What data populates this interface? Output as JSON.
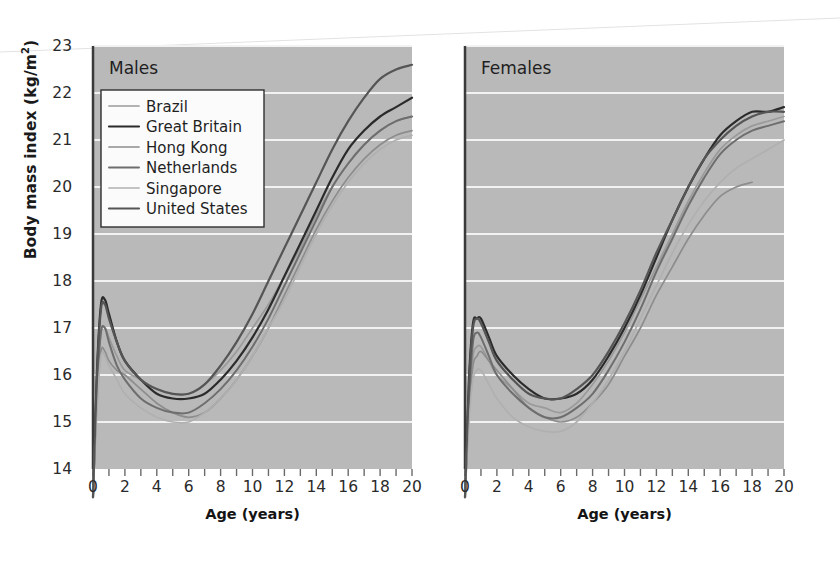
{
  "figure": {
    "background": "#ffffff",
    "plot_background": "#b9b9b9",
    "gridline_color": "#f2f2f2",
    "axis_color": "#3a3a3a"
  },
  "axes": {
    "ylabel_text": "Body mass index (kg/m",
    "ylabel_sup": "2",
    "ylabel_tail": ")",
    "ylabel_full": "Body mass index (kg/m2)",
    "yticks": [
      14,
      15,
      16,
      17,
      18,
      19,
      20,
      21,
      22,
      23
    ],
    "ylim": [
      14,
      23
    ],
    "xticks": [
      0,
      2,
      4,
      6,
      8,
      10,
      12,
      14,
      16,
      18,
      20
    ],
    "xlim": [
      0,
      20
    ],
    "xlabel": "Age (years)",
    "minor_xticks": [
      1,
      3,
      5,
      7,
      9,
      11,
      13,
      15,
      17,
      19
    ]
  },
  "panels": [
    {
      "id": "males",
      "title": "Males"
    },
    {
      "id": "females",
      "title": "Females"
    }
  ],
  "legend": {
    "position": "upper-left-of-males-panel",
    "entries": [
      {
        "label": "Brazil",
        "color": "#9a9a9a",
        "width": 1.7
      },
      {
        "label": "Great Britain",
        "color": "#2b2b2b",
        "width": 2.2
      },
      {
        "label": "Hong Kong",
        "color": "#8d8d8d",
        "width": 1.7
      },
      {
        "label": "Netherlands",
        "color": "#6e6e6e",
        "width": 2.0
      },
      {
        "label": "Singapore",
        "color": "#b0b0b0",
        "width": 1.7
      },
      {
        "label": "United States",
        "color": "#555555",
        "width": 2.2
      }
    ]
  },
  "chart_data": {
    "type": "line",
    "title": "",
    "xlabel": "Age (years)",
    "ylabel": "Body mass index (kg/m2)",
    "xlim": [
      0,
      20
    ],
    "ylim": [
      14,
      23
    ],
    "grid": "horizontal",
    "legend_position": "upper left (Males panel)",
    "x": [
      0,
      0.25,
      0.5,
      0.75,
      1,
      1.5,
      2,
      3,
      4,
      5,
      6,
      7,
      8,
      9,
      10,
      11,
      12,
      13,
      14,
      15,
      16,
      17,
      18,
      19,
      20
    ],
    "panels": [
      {
        "name": "Males",
        "series": [
          {
            "name": "Brazil",
            "color": "#9a9a9a",
            "values": [
              13.4,
              15.6,
              16.9,
              17.0,
              16.8,
              16.4,
              16.1,
              15.9,
              15.7,
              15.6,
              15.6,
              15.8,
              16.1,
              16.5,
              17.0,
              17.5,
              18.1,
              18.7,
              19.4,
              20.0,
              20.5,
              20.9,
              21.2,
              21.4,
              21.5
            ]
          },
          {
            "name": "Great Britain",
            "color": "#2b2b2b",
            "values": [
              13.4,
              16.1,
              17.5,
              17.6,
              17.3,
              16.7,
              16.3,
              15.9,
              15.6,
              15.5,
              15.5,
              15.6,
              15.9,
              16.3,
              16.8,
              17.4,
              18.1,
              18.8,
              19.5,
              20.2,
              20.8,
              21.2,
              21.5,
              21.7,
              21.9
            ]
          },
          {
            "name": "Hong Kong",
            "color": "#8d8d8d",
            "values": [
              13.4,
              15.4,
              16.5,
              16.5,
              16.3,
              16.1,
              16.0,
              15.7,
              15.4,
              15.2,
              15.1,
              15.2,
              15.5,
              15.9,
              16.4,
              17.0,
              17.7,
              18.4,
              19.1,
              19.7,
              20.2,
              20.6,
              20.9,
              21.1,
              21.2
            ]
          },
          {
            "name": "Netherlands",
            "color": "#6e6e6e",
            "values": [
              13.4,
              15.7,
              16.9,
              17.0,
              16.7,
              16.2,
              15.9,
              15.5,
              15.3,
              15.2,
              15.2,
              15.4,
              15.7,
              16.1,
              16.6,
              17.2,
              17.9,
              18.6,
              19.3,
              20.0,
              20.5,
              20.9,
              21.2,
              21.4,
              21.5
            ]
          },
          {
            "name": "Singapore",
            "color": "#b0b0b0",
            "values": [
              13.4,
              15.3,
              16.4,
              16.4,
              16.2,
              15.9,
              15.6,
              15.3,
              15.1,
              15.0,
              15.0,
              15.2,
              15.5,
              15.9,
              16.4,
              17.0,
              17.6,
              18.3,
              19.0,
              19.6,
              20.1,
              20.5,
              20.8,
              21.0,
              21.1
            ]
          },
          {
            "name": "United States",
            "color": "#555555",
            "values": [
              13.4,
              16.0,
              17.4,
              17.5,
              17.2,
              16.7,
              16.3,
              15.9,
              15.7,
              15.6,
              15.6,
              15.8,
              16.2,
              16.7,
              17.3,
              18.0,
              18.7,
              19.4,
              20.1,
              20.8,
              21.4,
              21.9,
              22.3,
              22.5,
              22.6
            ]
          }
        ]
      },
      {
        "name": "Females",
        "series": [
          {
            "name": "Brazil",
            "color": "#9a9a9a",
            "values": [
              13.4,
              15.3,
              16.4,
              16.6,
              16.6,
              16.3,
              16.0,
              15.7,
              15.4,
              15.3,
              15.2,
              15.4,
              15.8,
              16.3,
              16.9,
              17.6,
              18.3,
              19.0,
              19.7,
              20.3,
              20.8,
              21.1,
              21.3,
              21.4,
              21.5
            ]
          },
          {
            "name": "Great Britain",
            "color": "#2b2b2b",
            "values": [
              13.4,
              15.9,
              17.1,
              17.2,
              17.2,
              16.8,
              16.4,
              16.0,
              15.7,
              15.5,
              15.5,
              15.6,
              15.9,
              16.4,
              17.0,
              17.7,
              18.5,
              19.3,
              20.0,
              20.6,
              21.1,
              21.4,
              21.6,
              21.6,
              21.7
            ]
          },
          {
            "name": "Hong Kong",
            "color": "#8d8d8d",
            "values": [
              13.4,
              15.2,
              16.2,
              16.4,
              16.5,
              16.3,
              16.1,
              15.7,
              15.3,
              15.1,
              15.0,
              15.1,
              15.4,
              15.8,
              16.4,
              17.0,
              17.7,
              18.3,
              18.9,
              19.4,
              19.8,
              20.0,
              20.1,
              null,
              null
            ]
          },
          {
            "name": "Netherlands",
            "color": "#6e6e6e",
            "values": [
              13.4,
              15.5,
              16.7,
              16.9,
              16.8,
              16.4,
              16.0,
              15.6,
              15.3,
              15.1,
              15.1,
              15.3,
              15.6,
              16.1,
              16.7,
              17.4,
              18.2,
              18.9,
              19.6,
              20.2,
              20.7,
              21.0,
              21.2,
              21.3,
              21.4
            ]
          },
          {
            "name": "Singapore",
            "color": "#b0b0b0",
            "values": [
              13.4,
              15.0,
              15.9,
              16.1,
              16.1,
              15.8,
              15.5,
              15.1,
              14.9,
              14.8,
              14.8,
              15.0,
              15.4,
              15.9,
              16.5,
              17.2,
              17.9,
              18.6,
              19.2,
              19.7,
              20.1,
              20.4,
              20.6,
              20.8,
              21.0
            ]
          },
          {
            "name": "United States",
            "color": "#555555",
            "values": [
              13.4,
              15.8,
              17.0,
              17.2,
              17.1,
              16.7,
              16.3,
              15.9,
              15.6,
              15.5,
              15.5,
              15.7,
              16.0,
              16.5,
              17.1,
              17.8,
              18.6,
              19.3,
              20.0,
              20.6,
              21.0,
              21.3,
              21.5,
              21.6,
              21.6
            ]
          }
        ]
      }
    ]
  }
}
